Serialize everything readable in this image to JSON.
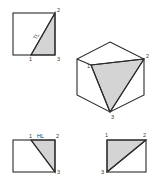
{
  "colors": {
    "line": "#2a2a2a",
    "shade": "#d4d4d4",
    "background": "#ffffff",
    "label": "#333333"
  },
  "figures": {
    "top_left_view": {
      "description": "square view with shaded triangle and true-length diagonal",
      "labels": {
        "p1": "1",
        "p2": "2",
        "p3": "3",
        "edge": "TL"
      }
    },
    "isometric_view": {
      "description": "cube (hexagonal outline) with shaded triangular plane 1-2-3",
      "labels": {
        "p1": "1",
        "p2": "2",
        "p3": "3"
      }
    },
    "bottom_left_view": {
      "description": "rectangle view with shaded triangle and horizontal line",
      "labels": {
        "p1": "1",
        "p2": "2",
        "p3": "3",
        "edge": "HL"
      }
    },
    "bottom_right_view": {
      "description": "rectangle view with shaded triangle",
      "labels": {
        "p1": "1",
        "p2": "2",
        "p3": "3"
      }
    }
  }
}
